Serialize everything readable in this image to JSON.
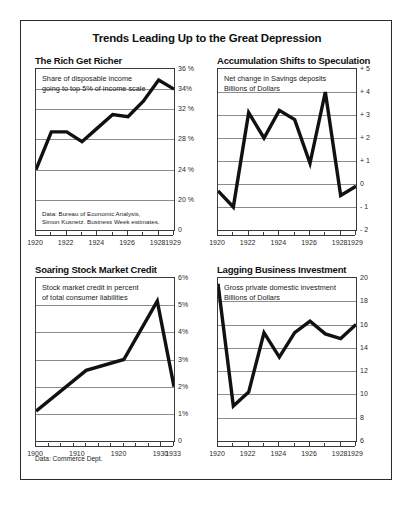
{
  "figure": {
    "title": "Trends Leading Up to the Great Depression",
    "footer_note": "Data: Commerce Dept.",
    "line_color": "#111111",
    "grid_color": "#8c8c8c",
    "frame_color": "#3a3a3a"
  },
  "panels": [
    {
      "title": "The Rich Get Richer",
      "caption_lines": [
        "Share of disposable income",
        "going to top 5% of income scale"
      ],
      "note_lines": [
        "Data: Bureau of Economic Analysis,",
        "Simon Kusnetz. Business Week estimates."
      ],
      "ylabels": [
        "36 %",
        "34%",
        "32 %",
        "28 %",
        "24 %",
        "20 %",
        "0"
      ],
      "xlabels": [
        "1920",
        "1922",
        "1924",
        "1926",
        "1928",
        "1929"
      ]
    },
    {
      "title": "Accumulation Shifts to Speculation",
      "caption_lines": [
        "Net change in Savings deposits",
        "Billions of Dollars"
      ],
      "note_lines": [],
      "ylabels": [
        "+ 5",
        "+ 4",
        "+ 3",
        "+ 2",
        "+ 1",
        "0",
        "- 1",
        "- 2"
      ],
      "xlabels": [
        "1920",
        "1922",
        "1924",
        "1926",
        "1928",
        "1929"
      ]
    },
    {
      "title": "Soaring Stock Market Credit",
      "caption_lines": [
        "Stock market credit in percent",
        "of total consumer liabilities"
      ],
      "note_lines": [],
      "ylabels": [
        "6%",
        "5%",
        "4%",
        "3%",
        "2%",
        "1%",
        "0"
      ],
      "xlabels": [
        "1900",
        "1910",
        "1920",
        "1930",
        "1933"
      ]
    },
    {
      "title": "Lagging Business Investment",
      "caption_lines": [
        "Gross private domestic investment",
        "Billions of Dollars"
      ],
      "note_lines": [],
      "ylabels": [
        "20",
        "18",
        "16",
        "14",
        "12",
        "10",
        "8",
        "6"
      ],
      "xlabels": [
        "1920",
        "1922",
        "1924",
        "1926",
        "1928",
        "1929"
      ]
    }
  ],
  "chart_data": [
    {
      "type": "line",
      "title": "The Rich Get Richer",
      "xlabel": "",
      "ylabel": "Percent",
      "note": "Share of disposable income going to top 5% of income scale. Non-linear y scale: 20-32 compressed, 32-36 expanded.",
      "x": [
        1920,
        1921,
        1922,
        1923,
        1924,
        1925,
        1926,
        1927,
        1928,
        1929
      ],
      "values": [
        24.0,
        29.0,
        29.0,
        27.7,
        29.5,
        31.3,
        31.0,
        32.8,
        34.9,
        34.0
      ],
      "yticks": [
        36,
        34,
        32,
        28,
        24,
        20,
        0
      ],
      "ytick_labels": [
        "36 %",
        "34%",
        "32 %",
        "28 %",
        "24 %",
        "20 %",
        "0"
      ],
      "ytick_positions_pct": [
        0,
        12.5,
        25,
        43.75,
        62.5,
        81.25,
        100
      ],
      "xticks": [
        1920,
        1922,
        1924,
        1926,
        1928,
        1929
      ],
      "grid": true,
      "legend": "none"
    },
    {
      "type": "line",
      "title": "Accumulation Shifts to Speculation",
      "xlabel": "",
      "ylabel": "Billions of Dollars",
      "note": "Net change in Savings deposits",
      "x": [
        1920,
        1921,
        1922,
        1923,
        1924,
        1925,
        1926,
        1927,
        1928,
        1929
      ],
      "values": [
        -0.3,
        -1.0,
        3.1,
        2.0,
        3.2,
        2.8,
        0.9,
        4.0,
        -0.5,
        -0.1
      ],
      "ylim": [
        -2,
        5
      ],
      "yticks": [
        5,
        4,
        3,
        2,
        1,
        0,
        -1,
        -2
      ],
      "ytick_labels": [
        "+ 5",
        "+ 4",
        "+ 3",
        "+ 2",
        "+ 1",
        "0",
        "- 1",
        "- 2"
      ],
      "xticks": [
        1920,
        1922,
        1924,
        1926,
        1928,
        1929
      ],
      "grid": true,
      "legend": "none"
    },
    {
      "type": "line",
      "title": "Soaring Stock Market Credit",
      "xlabel": "",
      "ylabel": "Percent",
      "note": "Stock market credit in percent of total consumer liabilities",
      "x": [
        1900,
        1912,
        1921,
        1929,
        1933
      ],
      "values": [
        1.1,
        2.6,
        3.0,
        5.15,
        2.0
      ],
      "ylim": [
        0,
        6
      ],
      "yticks": [
        6,
        5,
        4,
        3,
        2,
        1,
        0
      ],
      "ytick_labels": [
        "6%",
        "5%",
        "4%",
        "3%",
        "2%",
        "1%",
        "0"
      ],
      "xticks": [
        1900,
        1910,
        1920,
        1930,
        1933
      ],
      "grid": true,
      "legend": "none"
    },
    {
      "type": "line",
      "title": "Lagging Business Investment",
      "xlabel": "",
      "ylabel": "Billions of Dollars",
      "note": "Gross private domestic investment",
      "x": [
        1920,
        1921,
        1922,
        1923,
        1924,
        1925,
        1926,
        1927,
        1928,
        1929
      ],
      "values": [
        19.5,
        9.0,
        10.2,
        15.3,
        13.2,
        15.3,
        16.3,
        15.2,
        14.8,
        16.0
      ],
      "ylim": [
        6,
        20
      ],
      "yticks": [
        20,
        18,
        16,
        14,
        12,
        10,
        8,
        6
      ],
      "ytick_labels": [
        "20",
        "18",
        "16",
        "14",
        "12",
        "10",
        "8",
        "6"
      ],
      "xticks": [
        1920,
        1922,
        1924,
        1926,
        1928,
        1929
      ],
      "grid": true,
      "legend": "none"
    }
  ]
}
